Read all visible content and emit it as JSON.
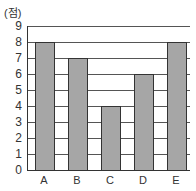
{
  "chart_data": {
    "type": "bar",
    "title": "",
    "unit_label": "(점)",
    "xlabel": "",
    "ylabel": "(점)",
    "categories": [
      "A",
      "B",
      "C",
      "D",
      "E"
    ],
    "values": [
      8,
      7,
      4,
      6,
      8
    ],
    "ylim": [
      0,
      9
    ],
    "yticks": [
      "0",
      "1",
      "2",
      "3",
      "4",
      "5",
      "6",
      "7",
      "8",
      "9"
    ],
    "grid": true,
    "legend": null,
    "bar_color": "#a6a6a6",
    "bar_edge_color": "#333333",
    "grid_color": "#555555"
  }
}
